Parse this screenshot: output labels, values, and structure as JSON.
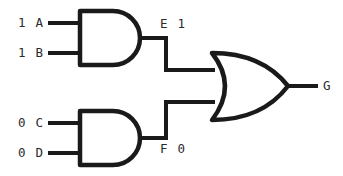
{
  "diagram": {
    "line_color": "#1a1a1a",
    "background_color": "#ffffff",
    "text_color": "#2b2b2b"
  },
  "inputs": [
    {
      "id": "a",
      "value": "1",
      "name": "A",
      "label": "1 A"
    },
    {
      "id": "b",
      "value": "1",
      "name": "B",
      "label": "1 B"
    },
    {
      "id": "c",
      "value": "0",
      "name": "C",
      "label": "0 C"
    },
    {
      "id": "d",
      "value": "0",
      "name": "D",
      "label": "0 D"
    }
  ],
  "gates": [
    {
      "id": "and1",
      "type": "AND",
      "output_label": "E 1",
      "output_name": "E",
      "output_value": "1"
    },
    {
      "id": "and2",
      "type": "AND",
      "output_label": "F 0",
      "output_name": "F",
      "output_value": "0"
    },
    {
      "id": "or1",
      "type": "OR",
      "output_label": "G",
      "output_name": "G"
    }
  ],
  "labels": {
    "input_a": "1 A",
    "input_b": "1 B",
    "input_c": "0 C",
    "input_d": "0 D",
    "and1_output": "E 1",
    "and2_output": "F 0",
    "or_output": "G"
  }
}
